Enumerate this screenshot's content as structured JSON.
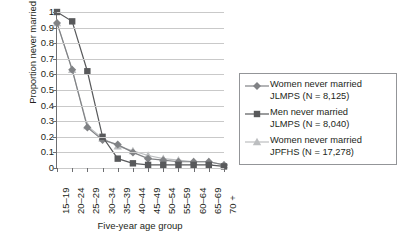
{
  "chart_data": {
    "type": "line",
    "title": "",
    "xlabel": "Five-year age group",
    "ylabel": "Proportion never married",
    "categories": [
      "15–19",
      "20–24",
      "25–29",
      "30–34",
      "35–39",
      "40–44",
      "45–49",
      "50–54",
      "55–59",
      "60–64",
      "65–69",
      "70 +"
    ],
    "ylim": [
      0,
      1
    ],
    "yticks": [
      "0",
      "0.1",
      "0.2",
      "0.3",
      "0.4",
      "0.5",
      "0.6",
      "0.7",
      "0.8",
      "0.9",
      "1"
    ],
    "ytick_values": [
      0,
      0.1,
      0.2,
      0.3,
      0.4,
      0.5,
      0.6,
      0.7,
      0.8,
      0.9,
      1
    ],
    "grid": true,
    "legend_position": "right",
    "series": [
      {
        "name": "Women never married JLMPS (N = 8,125)",
        "marker": "diamond",
        "color": "#808285",
        "values": [
          0.93,
          0.63,
          0.26,
          0.18,
          0.15,
          0.1,
          0.06,
          0.05,
          0.04,
          0.04,
          0.04,
          0.02
        ]
      },
      {
        "name": "Men never married JLMPS (N = 8,040)",
        "marker": "square",
        "color": "#58595b",
        "values": [
          1.0,
          0.94,
          0.62,
          0.2,
          0.06,
          0.03,
          0.02,
          0.02,
          0.02,
          0.02,
          0.02,
          0.01
        ]
      },
      {
        "name": "Women never married JPFHS (N = 17,278)",
        "marker": "triangle",
        "color": "#bcbec0",
        "values": [
          0.93,
          0.63,
          0.27,
          0.19,
          0.14,
          0.11,
          0.08,
          0.06,
          0.05,
          0.04,
          0.04,
          0.02
        ]
      }
    ]
  },
  "legend": {
    "items": [
      {
        "line1": "Women never married",
        "line2": "JLMPS (N = 8,125)",
        "marker": "diamond-marker-icon",
        "color": "#808285"
      },
      {
        "line1": "Men never married",
        "line2": "JLMPS (N = 8,040)",
        "marker": "square-marker-icon",
        "color": "#58595b"
      },
      {
        "line1": "Women never married",
        "line2": "JPFHS (N = 17,278)",
        "marker": "triangle-marker-icon",
        "color": "#bcbec0"
      }
    ]
  },
  "axes": {
    "y_title": "Proportion never married",
    "x_title": "Five-year age group"
  }
}
